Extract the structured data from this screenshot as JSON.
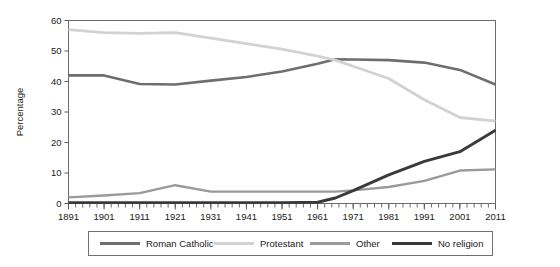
{
  "chart_data": {
    "type": "line",
    "title": "",
    "xlabel": "",
    "ylabel": "Percentage",
    "xlim": [
      1891,
      2011
    ],
    "ylim": [
      0,
      60
    ],
    "grid": false,
    "legend_position": "bottom",
    "x": [
      1891,
      1901,
      1911,
      1921,
      1931,
      1941,
      1951,
      1961,
      1966,
      1971,
      1981,
      1991,
      2001,
      2011
    ],
    "xtick_labels": [
      "1891",
      "1901",
      "1911",
      "1921",
      "1931",
      "1941",
      "1951",
      "1961",
      "1971",
      "1981",
      "1991",
      "2001",
      "2011"
    ],
    "xtick_values": [
      1891,
      1901,
      1911,
      1921,
      1931,
      1941,
      1951,
      1961,
      1971,
      1981,
      1991,
      2001,
      2011
    ],
    "ytick_labels": [
      "0",
      "10",
      "20",
      "30",
      "40",
      "50",
      "60"
    ],
    "ytick_values": [
      0,
      10,
      20,
      30,
      40,
      50,
      60
    ],
    "minor_xtick_step": 2,
    "series": [
      {
        "name": "Roman Catholic",
        "color": "#6e6e6e",
        "width": 2.6,
        "values": [
          42.0,
          42.0,
          39.2,
          39.0,
          40.3,
          41.5,
          43.3,
          45.8,
          47.3,
          47.2,
          47.0,
          46.2,
          43.8,
          39.0
        ]
      },
      {
        "name": "Protestant",
        "color": "#d2d2d2",
        "width": 2.8,
        "values": [
          57.0,
          56.0,
          55.8,
          56.0,
          54.2,
          52.4,
          50.6,
          48.3,
          47.0,
          45.0,
          41.0,
          34.0,
          28.2,
          27.0
        ]
      },
      {
        "name": "Other",
        "color": "#9a9a9a",
        "width": 2.4,
        "values": [
          2.0,
          2.6,
          3.4,
          6.0,
          3.9,
          3.9,
          3.9,
          3.9,
          3.9,
          4.3,
          5.4,
          7.4,
          10.8,
          11.2
        ]
      },
      {
        "name": "No religion",
        "color": "#3a3a3a",
        "width": 2.9,
        "values": [
          0.3,
          0.3,
          0.3,
          0.3,
          0.3,
          0.3,
          0.3,
          0.4,
          1.8,
          4.2,
          9.4,
          13.8,
          17.0,
          24.0
        ]
      }
    ]
  },
  "legend": {
    "items": [
      {
        "label": "Roman Catholic",
        "color": "#6e6e6e"
      },
      {
        "label": "Protestant",
        "color": "#d2d2d2"
      },
      {
        "label": "Other",
        "color": "#9a9a9a"
      },
      {
        "label": "No religion",
        "color": "#3a3a3a"
      }
    ]
  }
}
